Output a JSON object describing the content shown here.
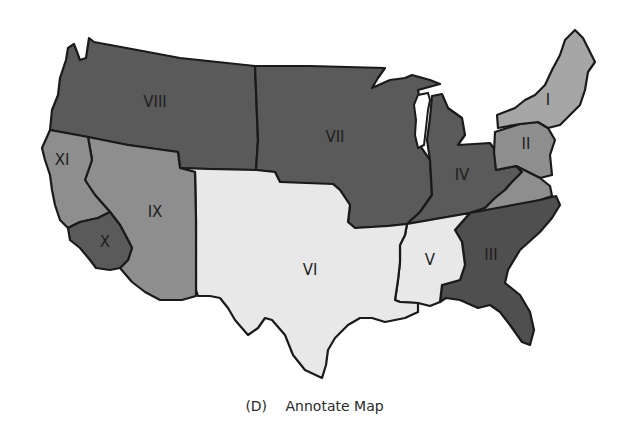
{
  "figure": {
    "caption_letter": "(D)",
    "caption_text": "Annotate Map"
  },
  "map": {
    "colors": {
      "dark": "#5a5a5a",
      "darker": "#4f4f4f",
      "medium": "#8e8e8e",
      "light": "#a6a6a6",
      "pale": "#e8e8e8",
      "border": "#1a1a1a"
    },
    "regions": [
      {
        "id": "I",
        "label": "I",
        "shade": "light"
      },
      {
        "id": "II",
        "label": "II",
        "shade": "medium"
      },
      {
        "id": "III",
        "label": "III",
        "shade": "darker"
      },
      {
        "id": "IV",
        "label": "IV",
        "shade": "dark"
      },
      {
        "id": "V",
        "label": "V",
        "shade": "pale"
      },
      {
        "id": "VI",
        "label": "VI",
        "shade": "pale"
      },
      {
        "id": "VII",
        "label": "VII",
        "shade": "dark"
      },
      {
        "id": "VIII",
        "label": "VIII",
        "shade": "dark"
      },
      {
        "id": "IX",
        "label": "IX",
        "shade": "medium"
      },
      {
        "id": "X",
        "label": "X",
        "shade": "dark"
      },
      {
        "id": "XI",
        "label": "XI",
        "shade": "medium"
      }
    ]
  }
}
